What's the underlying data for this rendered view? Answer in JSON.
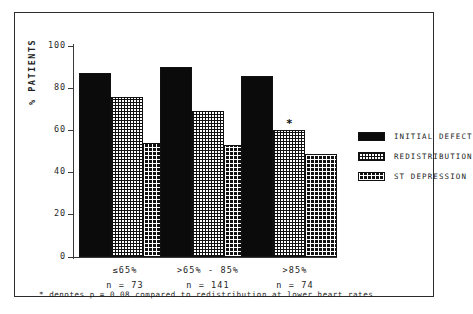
{
  "chart_data": {
    "type": "bar",
    "title": "",
    "xlabel": "",
    "ylabel": "% PATIENTS",
    "ylim": [
      0,
      100
    ],
    "yticks": [
      0,
      20,
      40,
      60,
      80,
      100
    ],
    "grid": false,
    "legend_position": "right",
    "categories": [
      "≤65%",
      ">65% - 85%",
      ">85%"
    ],
    "category_counts": [
      "n = 73",
      "n = 141",
      "n = 74"
    ],
    "series": [
      {
        "name": "INITIAL DEFECT",
        "values": [
          87,
          90,
          86
        ]
      },
      {
        "name": "REDISTRIBUTION",
        "values": [
          76,
          69,
          60
        ]
      },
      {
        "name": "ST DEPRESSION",
        "values": [
          54,
          53,
          49
        ]
      }
    ],
    "annotations": [
      {
        "text": "*",
        "series": "REDISTRIBUTION",
        "category": ">85%"
      }
    ],
    "footnote": "* denotes p = 0.08 compared to redistribution at lower heart rates"
  },
  "axis": {
    "y_label": "% PATIENTS",
    "y_tick_labels": [
      "100",
      "80",
      "60",
      "40",
      "20",
      "0"
    ]
  },
  "groups": [
    {
      "label": "≤65%",
      "count": "n = 73"
    },
    {
      "label": ">65% - 85%",
      "count": "n = 141"
    },
    {
      "label": ">85%",
      "count": "n = 74"
    }
  ],
  "legend": {
    "items": [
      {
        "label": "INITIAL DEFECT",
        "pattern": "solid-black-swatch"
      },
      {
        "label": "REDISTRIBUTION",
        "pattern": "cross-hatch-swatch"
      },
      {
        "label": "ST DEPRESSION",
        "pattern": "checker-dot-swatch"
      }
    ]
  },
  "footnote": {
    "text": "* denotes p = 0.08 compared to redistribution at lower heart rates"
  },
  "marker": {
    "symbol": "*"
  }
}
